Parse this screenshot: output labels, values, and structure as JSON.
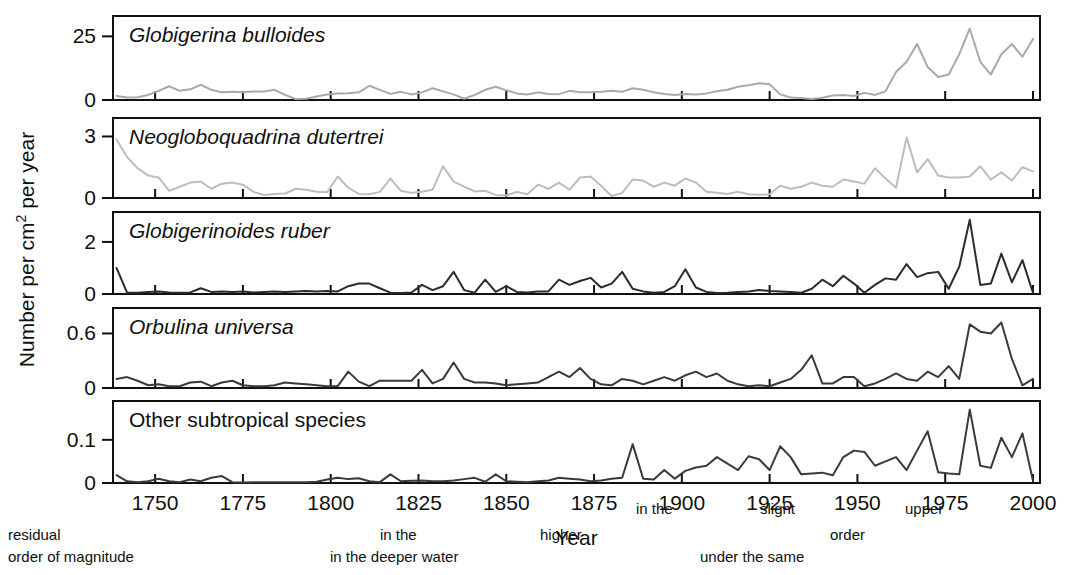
{
  "figure": {
    "axis_titles": {
      "x": "Year",
      "y_plain": "Number per cm2 per year",
      "y_prefix": "Number per cm",
      "y_super": "2",
      "y_suffix": " per year"
    },
    "background_bleed": [
      {
        "text": "in the",
        "x": 636,
        "y": 514
      },
      {
        "text": "slight",
        "x": 760,
        "y": 514
      },
      {
        "text": "upper",
        "x": 905,
        "y": 514
      },
      {
        "text": "residual",
        "x": 8,
        "y": 540
      },
      {
        "text": "in the",
        "x": 380,
        "y": 540
      },
      {
        "text": "higher",
        "x": 540,
        "y": 540
      },
      {
        "text": "order",
        "x": 830,
        "y": 540
      },
      {
        "text": "order of magnitude",
        "x": 8,
        "y": 562
      },
      {
        "text": "in the deeper water",
        "x": 330,
        "y": 562
      },
      {
        "text": "under the same",
        "x": 700,
        "y": 562
      }
    ]
  },
  "chart_data": {
    "type": "line",
    "title": "",
    "xlabel": "Year",
    "ylabel": "Number per cm2 per year",
    "grid": false,
    "legend": "none",
    "xlim": [
      1738,
      2002
    ],
    "xticks": [
      1750,
      1775,
      1800,
      1825,
      1850,
      1875,
      1900,
      1925,
      1950,
      1975,
      2000
    ],
    "xticklabels": [
      "1750",
      "1775",
      "1800",
      "1825",
      "1850",
      "1875",
      "1900",
      "1925",
      "1950",
      "1975",
      "2000"
    ],
    "panels": [
      {
        "label": "Globigerina bulloides",
        "italic": true,
        "color": "#a9a9a9",
        "ylim": [
          0,
          33
        ],
        "yticks": [
          0,
          25
        ],
        "yticklabels": [
          "0",
          "25"
        ],
        "x": [
          1739,
          1742,
          1745,
          1748,
          1751,
          1754,
          1757,
          1760,
          1763,
          1766,
          1769,
          1772,
          1775,
          1778,
          1781,
          1784,
          1787,
          1790,
          1793,
          1796,
          1799,
          1802,
          1805,
          1808,
          1811,
          1814,
          1817,
          1820,
          1823,
          1826,
          1829,
          1832,
          1835,
          1838,
          1841,
          1844,
          1847,
          1850,
          1853,
          1856,
          1859,
          1862,
          1865,
          1868,
          1871,
          1874,
          1877,
          1880,
          1883,
          1886,
          1889,
          1892,
          1895,
          1898,
          1901,
          1904,
          1907,
          1910,
          1913,
          1916,
          1919,
          1922,
          1925,
          1928,
          1931,
          1934,
          1937,
          1940,
          1943,
          1946,
          1949,
          1952,
          1955,
          1958,
          1961,
          1964,
          1967,
          1970,
          1973,
          1976,
          1979,
          1982,
          1985,
          1988,
          1991,
          1994,
          1997,
          2000
        ],
        "y": [
          1.6,
          1.0,
          1.1,
          2.0,
          3.6,
          5.4,
          3.6,
          4.2,
          6.0,
          4.0,
          3.0,
          3.2,
          3.0,
          3.3,
          3.3,
          4.0,
          2.0,
          0.4,
          0.5,
          1.4,
          2.2,
          2.6,
          2.7,
          3.0,
          5.6,
          4.0,
          2.4,
          3.2,
          2.2,
          3.0,
          4.6,
          3.4,
          2.2,
          0.5,
          2.0,
          4.0,
          5.2,
          3.8,
          2.6,
          2.2,
          3.0,
          2.4,
          2.3,
          3.6,
          3.0,
          3.0,
          3.2,
          3.6,
          3.2,
          4.6,
          4.0,
          3.0,
          2.4,
          2.0,
          2.4,
          2.2,
          2.6,
          3.4,
          4.0,
          5.2,
          5.8,
          6.6,
          6.2,
          2.2,
          1.0,
          0.8,
          0.4,
          0.9,
          1.8,
          2.0,
          1.6,
          2.8,
          2.0,
          3.4,
          11.0,
          15.0,
          22.0,
          13.0,
          9.0,
          10.0,
          18.0,
          28.0,
          15.0,
          10.0,
          18.0,
          22.0,
          17.0,
          24.0
        ]
      },
      {
        "label": "Neogloboquadrina dutertrei",
        "italic": true,
        "color": "#bdbdbd",
        "ylim": [
          0,
          3.9
        ],
        "yticks": [
          0,
          3
        ],
        "yticklabels": [
          "0",
          "3"
        ],
        "x": [
          1739,
          1742,
          1745,
          1748,
          1751,
          1754,
          1757,
          1760,
          1763,
          1766,
          1769,
          1772,
          1775,
          1778,
          1781,
          1784,
          1787,
          1790,
          1793,
          1796,
          1799,
          1802,
          1805,
          1808,
          1811,
          1814,
          1817,
          1820,
          1823,
          1826,
          1829,
          1832,
          1835,
          1838,
          1841,
          1844,
          1847,
          1850,
          1853,
          1856,
          1859,
          1862,
          1865,
          1868,
          1871,
          1874,
          1877,
          1880,
          1883,
          1886,
          1889,
          1892,
          1895,
          1898,
          1901,
          1904,
          1907,
          1910,
          1913,
          1916,
          1919,
          1922,
          1925,
          1928,
          1931,
          1934,
          1937,
          1940,
          1943,
          1946,
          1949,
          1952,
          1955,
          1958,
          1961,
          1964,
          1967,
          1970,
          1973,
          1976,
          1979,
          1982,
          1985,
          1988,
          1991,
          1994,
          1997,
          2000
        ],
        "y": [
          2.85,
          2.0,
          1.45,
          1.1,
          1.0,
          0.35,
          0.55,
          0.75,
          0.8,
          0.45,
          0.7,
          0.75,
          0.65,
          0.3,
          0.15,
          0.2,
          0.22,
          0.45,
          0.4,
          0.3,
          0.28,
          1.05,
          0.5,
          0.2,
          0.18,
          0.3,
          0.95,
          0.35,
          0.25,
          0.3,
          0.4,
          1.55,
          0.8,
          0.55,
          0.32,
          0.35,
          0.15,
          0.12,
          0.3,
          0.18,
          0.65,
          0.45,
          0.75,
          0.4,
          1.0,
          1.05,
          0.6,
          0.1,
          0.25,
          0.9,
          0.85,
          0.55,
          0.75,
          0.6,
          0.95,
          0.75,
          0.3,
          0.25,
          0.2,
          0.3,
          0.18,
          0.16,
          0.18,
          0.6,
          0.45,
          0.55,
          0.75,
          0.6,
          0.55,
          0.9,
          0.8,
          0.7,
          1.45,
          0.95,
          0.5,
          2.95,
          1.25,
          1.9,
          1.1,
          1.0,
          1.0,
          1.05,
          1.55,
          0.9,
          1.25,
          0.85,
          1.5,
          1.3
        ]
      },
      {
        "label": "Globigerinoides ruber",
        "italic": true,
        "color": "#2b2b2b",
        "ylim": [
          0,
          3.15
        ],
        "yticks": [
          0,
          2
        ],
        "yticklabels": [
          "0",
          "2"
        ],
        "x": [
          1739,
          1742,
          1745,
          1748,
          1751,
          1754,
          1757,
          1760,
          1763,
          1766,
          1769,
          1772,
          1775,
          1778,
          1781,
          1784,
          1787,
          1790,
          1793,
          1796,
          1799,
          1802,
          1805,
          1808,
          1811,
          1814,
          1817,
          1820,
          1823,
          1826,
          1829,
          1832,
          1835,
          1838,
          1841,
          1844,
          1847,
          1850,
          1853,
          1856,
          1859,
          1862,
          1865,
          1868,
          1871,
          1874,
          1877,
          1880,
          1883,
          1886,
          1889,
          1892,
          1895,
          1898,
          1901,
          1904,
          1907,
          1910,
          1913,
          1916,
          1919,
          1922,
          1925,
          1928,
          1931,
          1934,
          1937,
          1940,
          1943,
          1946,
          1949,
          1952,
          1955,
          1958,
          1961,
          1964,
          1967,
          1970,
          1973,
          1976,
          1979,
          1982,
          1985,
          1988,
          1991,
          1994,
          1997,
          2000
        ],
        "y": [
          1.0,
          0.05,
          0.05,
          0.08,
          0.1,
          0.06,
          0.05,
          0.06,
          0.22,
          0.08,
          0.1,
          0.08,
          0.1,
          0.06,
          0.08,
          0.1,
          0.08,
          0.1,
          0.12,
          0.1,
          0.12,
          0.1,
          0.3,
          0.4,
          0.4,
          0.22,
          0.05,
          0.04,
          0.06,
          0.35,
          0.15,
          0.3,
          0.85,
          0.15,
          0.05,
          0.55,
          0.08,
          0.3,
          0.08,
          0.06,
          0.1,
          0.1,
          0.55,
          0.35,
          0.5,
          0.62,
          0.25,
          0.4,
          0.85,
          0.2,
          0.1,
          0.05,
          0.08,
          0.3,
          0.95,
          0.25,
          0.08,
          0.04,
          0.05,
          0.08,
          0.1,
          0.15,
          0.12,
          0.1,
          0.08,
          0.05,
          0.2,
          0.55,
          0.3,
          0.7,
          0.4,
          0.05,
          0.35,
          0.6,
          0.55,
          1.15,
          0.65,
          0.8,
          0.85,
          0.2,
          1.05,
          2.85,
          0.35,
          0.4,
          1.55,
          0.45,
          1.3,
          0.05
        ]
      },
      {
        "label": "Orbulina universa",
        "italic": true,
        "color": "#3a3a3a",
        "ylim": [
          0,
          0.88
        ],
        "yticks": [
          0,
          0.6
        ],
        "yticklabels": [
          "0",
          "0.6"
        ],
        "x": [
          1739,
          1742,
          1745,
          1748,
          1751,
          1754,
          1757,
          1760,
          1763,
          1766,
          1769,
          1772,
          1775,
          1778,
          1781,
          1784,
          1787,
          1790,
          1793,
          1796,
          1799,
          1802,
          1805,
          1808,
          1811,
          1814,
          1817,
          1820,
          1823,
          1826,
          1829,
          1832,
          1835,
          1838,
          1841,
          1844,
          1847,
          1850,
          1853,
          1856,
          1859,
          1862,
          1865,
          1868,
          1871,
          1874,
          1877,
          1880,
          1883,
          1886,
          1889,
          1892,
          1895,
          1898,
          1901,
          1904,
          1907,
          1910,
          1913,
          1916,
          1919,
          1922,
          1925,
          1928,
          1931,
          1934,
          1937,
          1940,
          1943,
          1946,
          1949,
          1952,
          1955,
          1958,
          1961,
          1964,
          1967,
          1970,
          1973,
          1976,
          1979,
          1982,
          1985,
          1988,
          1991,
          1994,
          1997,
          2000
        ],
        "y": [
          0.1,
          0.12,
          0.08,
          0.03,
          0.04,
          0.02,
          0.02,
          0.06,
          0.07,
          0.02,
          0.06,
          0.08,
          0.03,
          0.02,
          0.02,
          0.03,
          0.06,
          0.05,
          0.04,
          0.03,
          0.02,
          0.02,
          0.18,
          0.07,
          0.02,
          0.08,
          0.08,
          0.08,
          0.08,
          0.2,
          0.05,
          0.1,
          0.28,
          0.1,
          0.06,
          0.06,
          0.05,
          0.03,
          0.04,
          0.05,
          0.06,
          0.12,
          0.18,
          0.12,
          0.22,
          0.1,
          0.04,
          0.03,
          0.1,
          0.08,
          0.04,
          0.08,
          0.12,
          0.08,
          0.14,
          0.18,
          0.12,
          0.16,
          0.08,
          0.04,
          0.02,
          0.03,
          0.02,
          0.06,
          0.1,
          0.2,
          0.36,
          0.05,
          0.05,
          0.12,
          0.12,
          0.02,
          0.05,
          0.1,
          0.16,
          0.1,
          0.08,
          0.18,
          0.12,
          0.24,
          0.1,
          0.7,
          0.62,
          0.6,
          0.72,
          0.32,
          0.03,
          0.1
        ]
      },
      {
        "label": "Other subtropical species",
        "italic": false,
        "color": "#3a3a3a",
        "ylim": [
          0,
          0.19
        ],
        "yticks": [
          0,
          0.1
        ],
        "yticklabels": [
          "0",
          "0.1"
        ],
        "x": [
          1739,
          1742,
          1745,
          1748,
          1751,
          1754,
          1757,
          1760,
          1763,
          1766,
          1769,
          1772,
          1775,
          1778,
          1781,
          1784,
          1787,
          1790,
          1793,
          1796,
          1799,
          1802,
          1805,
          1808,
          1811,
          1814,
          1817,
          1820,
          1823,
          1826,
          1829,
          1832,
          1835,
          1838,
          1841,
          1844,
          1847,
          1850,
          1853,
          1856,
          1859,
          1862,
          1865,
          1868,
          1871,
          1874,
          1877,
          1880,
          1883,
          1886,
          1889,
          1892,
          1895,
          1898,
          1901,
          1904,
          1907,
          1910,
          1913,
          1916,
          1919,
          1922,
          1925,
          1928,
          1931,
          1934,
          1937,
          1940,
          1943,
          1946,
          1949,
          1952,
          1955,
          1958,
          1961,
          1964,
          1967,
          1970,
          1973,
          1976,
          1979,
          1982,
          1985,
          1988,
          1991,
          1994,
          1997,
          2000
        ],
        "y": [
          0.018,
          0.004,
          0.002,
          0.004,
          0.01,
          0.004,
          0.002,
          0.008,
          0.004,
          0.012,
          0.016,
          0.002,
          0.001,
          0.002,
          0.002,
          0.002,
          0.002,
          0.002,
          0.002,
          0.003,
          0.008,
          0.012,
          0.009,
          0.011,
          0.004,
          0.002,
          0.02,
          0.004,
          0.005,
          0.006,
          0.004,
          0.004,
          0.006,
          0.009,
          0.012,
          0.003,
          0.02,
          0.004,
          0.003,
          0.002,
          0.004,
          0.006,
          0.012,
          0.01,
          0.008,
          0.004,
          0.006,
          0.01,
          0.012,
          0.09,
          0.01,
          0.008,
          0.03,
          0.01,
          0.028,
          0.036,
          0.04,
          0.06,
          0.045,
          0.03,
          0.062,
          0.055,
          0.03,
          0.085,
          0.06,
          0.02,
          0.022,
          0.024,
          0.018,
          0.06,
          0.075,
          0.072,
          0.04,
          0.05,
          0.06,
          0.03,
          0.075,
          0.12,
          0.025,
          0.022,
          0.02,
          0.17,
          0.04,
          0.035,
          0.105,
          0.06,
          0.115,
          0.005
        ]
      }
    ]
  }
}
